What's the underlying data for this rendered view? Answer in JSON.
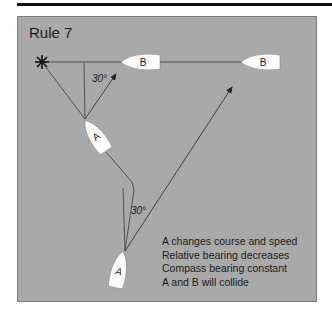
{
  "figure": {
    "title": "Rule 7",
    "colors": {
      "panel": "#a9a9a9",
      "boat_fill": "#ffffff",
      "line": "#333333"
    },
    "angles": {
      "upper": "30°",
      "lower": "30°"
    },
    "boats": [
      {
        "label": "A",
        "role": "give-way vessel (later position)"
      },
      {
        "label": "A",
        "role": "give-way vessel (earlier position)"
      },
      {
        "label": "B",
        "role": "crossing vessel (later position)"
      },
      {
        "label": "B",
        "role": "crossing vessel (earlier position)"
      }
    ],
    "notes": [
      "A changes course and speed",
      "Relative bearing decreases",
      "Compass bearing constant",
      "A and B will collide"
    ]
  }
}
